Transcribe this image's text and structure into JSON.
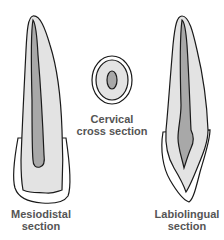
{
  "figure": {
    "colors": {
      "outline": "#1a1a1a",
      "enamel": "#ffffff",
      "dentin": "#e3e3e3",
      "pulp": "#a8a8a8",
      "label_text": "#555555"
    }
  },
  "labels": {
    "mesiodistal": {
      "line1": "Mesiodistal",
      "line2": "section"
    },
    "cervical": {
      "line1": "Cervical",
      "line2": "cross section"
    },
    "labiolingual": {
      "line1": "Labiolingual",
      "line2": "section"
    }
  }
}
